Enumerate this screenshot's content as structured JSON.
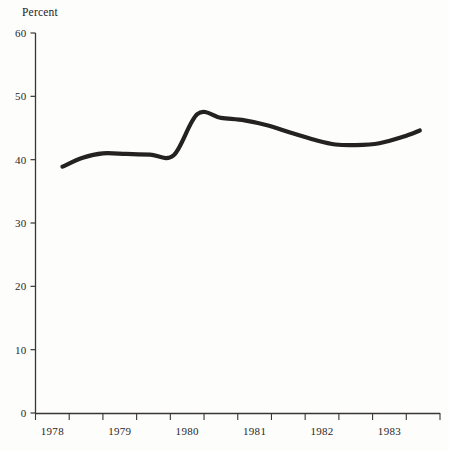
{
  "figure": {
    "axis_label_y": "Percent",
    "line_color": "#242220",
    "axis_color": "#3a3634",
    "background": "#fdfdfc"
  },
  "chart_data": {
    "type": "line",
    "title": "",
    "subtitle": "",
    "xlabel": "",
    "ylabel": "Percent",
    "ylim": [
      0,
      60
    ],
    "xlim": [
      1977.75,
      1983.75
    ],
    "yticks": [
      0,
      10,
      20,
      30,
      40,
      50,
      60
    ],
    "ytick_labels": [
      "0",
      "10",
      "20",
      "30",
      "40",
      "50",
      "60"
    ],
    "xtick_labels": [
      "1978",
      "1979",
      "1980",
      "1981",
      "1982",
      "1983"
    ],
    "xtick_values": [
      1978,
      1979,
      1980,
      1981,
      1982,
      1983
    ],
    "minor_xticks": [
      1977.75,
      1978.25,
      1978.75,
      1979.25,
      1979.75,
      1980.25,
      1980.75,
      1981.25,
      1981.75,
      1982.25,
      1982.75,
      1983.25,
      1983.75
    ],
    "grid": false,
    "legend": false,
    "legend_position": "none",
    "series": [
      {
        "name": "Percent",
        "x": [
          1978.15,
          1978.45,
          1978.75,
          1979.1,
          1979.45,
          1979.8,
          1980.15,
          1980.5,
          1980.85,
          1981.2,
          1981.55,
          1981.9,
          1982.2,
          1982.5,
          1982.85,
          1983.2,
          1983.45
        ],
        "values": [
          38.9,
          40.3,
          41.0,
          40.9,
          40.8,
          40.7,
          47.2,
          46.6,
          46.2,
          45.4,
          44.2,
          43.1,
          42.4,
          42.3,
          42.6,
          43.6,
          44.6
        ]
      }
    ]
  }
}
